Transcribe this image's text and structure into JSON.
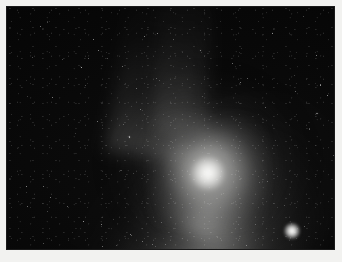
{
  "image": {
    "title": "Comet astrophotograph",
    "subject": "comet",
    "caption": "",
    "medium": "monochrome astronomical photograph",
    "frame": {
      "canvas_width": 342,
      "canvas_height": 262,
      "border_color": "#f2f2f0",
      "border_width_px": 7,
      "plate_left": 7,
      "plate_top": 7,
      "plate_width": 327,
      "plate_height": 242
    },
    "palette": {
      "sky_black": "#050505",
      "sky_deep": "#030303",
      "coma_gray": "#a9a9a7",
      "nucleus_white": "#ffffff",
      "tail_gray": "#6e6e6d",
      "star_white": "#ffffff",
      "frame_paper": "#f2f2f0"
    },
    "features": [
      {
        "name": "nucleus",
        "label": "comet nucleus",
        "center_x": 201,
        "center_y": 166,
        "radius_px": 22,
        "brightness": "saturated white core"
      },
      {
        "name": "coma",
        "label": "coma",
        "center_x": 201,
        "center_y": 164,
        "radius_px": 115,
        "brightness": "diffuse halo fading to sky"
      },
      {
        "name": "dust-tail",
        "label": "dust tail",
        "direction": "upper-left",
        "position_angle_deg": 31,
        "length_px": 230,
        "brightness": "broad fan, reaches top edge of frame"
      },
      {
        "name": "tail-streamer",
        "label": "faint tail streamer",
        "direction": "up",
        "position_angle_deg": 9,
        "length_px": 150,
        "brightness": "very faint"
      },
      {
        "name": "field-star",
        "label": "bright field star",
        "center_x": 292,
        "center_y": 231,
        "radius_px": 5,
        "brightness": "point source"
      }
    ],
    "background": {
      "description": "dense faint star field with sensor noise",
      "star_count_visible": 96
    }
  }
}
